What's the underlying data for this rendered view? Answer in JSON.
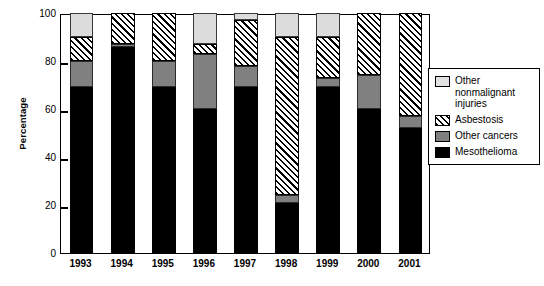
{
  "chart_data": {
    "type": "bar",
    "stacked": true,
    "title": "",
    "xlabel": "",
    "ylabel": "Percentage",
    "ylim": [
      0,
      100
    ],
    "yticks": [
      0,
      20,
      40,
      60,
      80,
      100
    ],
    "grid": false,
    "legend_position": "right",
    "categories": [
      "1993",
      "1994",
      "1995",
      "1996",
      "1997",
      "1998",
      "1999",
      "2000",
      "2001"
    ],
    "series": [
      {
        "name": "Mesothelioma",
        "swatch": "black-solid",
        "color": "#000000",
        "values": [
          69,
          86,
          69,
          60,
          69,
          21,
          69,
          60,
          52
        ]
      },
      {
        "name": "Other cancers",
        "swatch": "gray-solid",
        "color": "#808080",
        "values": [
          11,
          1,
          11,
          23,
          9,
          3,
          4,
          14,
          5
        ]
      },
      {
        "name": "Asbestosis",
        "swatch": "diagonal-hatch",
        "color": "#000000",
        "values": [
          10,
          13,
          20,
          4,
          19,
          66,
          17,
          26,
          43
        ]
      },
      {
        "name": "Other nonmalignant injuries",
        "swatch": "light-gray-solid",
        "color": "#dcdcdc",
        "values": [
          10,
          0,
          0,
          13,
          3,
          10,
          10,
          0,
          0
        ]
      }
    ],
    "legend_entries": [
      "Other nonmalignant injuries",
      "Asbestosis",
      "Other cancers",
      "Mesothelioma"
    ]
  }
}
